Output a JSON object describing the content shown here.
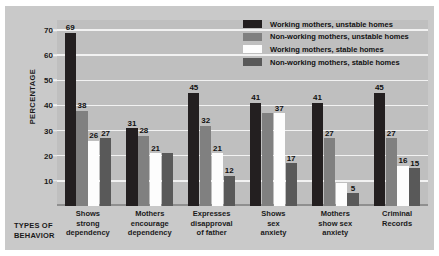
{
  "chart_data": {
    "type": "bar",
    "title": "",
    "xlabel": "TYPES OF BEHAVIOR",
    "ylabel": "PERCENTAGE",
    "ylim": [
      0,
      74
    ],
    "yticks": [
      10,
      20,
      30,
      40,
      50,
      60,
      70
    ],
    "grid": true,
    "legend_position": "top-right",
    "categories": [
      "Shows\nstrong\ndependency",
      "Mothers\nencourage\ndependency",
      "Expresses\ndisapproval\nof father",
      "Shows\nsex\nanxiety",
      "Mothers\nshow sex\nanxiety",
      "Criminal\nRecords"
    ],
    "series": [
      {
        "name": "Working mothers, unstable homes",
        "color": "#231f20",
        "values": [
          69,
          31,
          45,
          41,
          41,
          45
        ]
      },
      {
        "name": "Non-working mothers, unstable homes",
        "color": "#808080",
        "values": [
          38,
          28,
          32,
          37,
          27,
          27
        ]
      },
      {
        "name": "Working mothers, stable homes",
        "color": "#fdfdfd",
        "values": [
          26,
          21,
          21,
          37,
          9,
          16
        ]
      },
      {
        "name": "Non-working mothers, stable homes",
        "color": "#595959",
        "values": [
          27,
          21,
          12,
          17,
          5,
          15
        ]
      }
    ],
    "point_labels": [
      [
        "69",
        "38",
        "26",
        "27"
      ],
      [
        "31",
        "28",
        "21",
        ""
      ],
      [
        "45",
        "32",
        "21",
        "12"
      ],
      [
        "41",
        "",
        "37",
        "17"
      ],
      [
        "41",
        "27",
        "",
        "5"
      ],
      [
        "45",
        "27",
        "16",
        "15"
      ]
    ]
  },
  "axis": {
    "y_title": "PERCENTAGE",
    "x_title_line1": "TYPES OF",
    "x_title_line2": "BEHAVIOR",
    "ticks": [
      "70",
      "60",
      "50",
      "40",
      "30",
      "20",
      "10"
    ]
  },
  "legend": {
    "items": [
      {
        "label": "Working mothers, unstable homes",
        "color": "#231f20"
      },
      {
        "label": "Non-working mothers, unstable homes",
        "color": "#808080"
      },
      {
        "label": "Working mothers, stable homes",
        "color": "#fdfdfd"
      },
      {
        "label": "Non-working mothers, stable homes",
        "color": "#595959"
      }
    ]
  },
  "categories": [
    {
      "l1": "Shows",
      "l2": "strong",
      "l3": "dependency"
    },
    {
      "l1": "Mothers",
      "l2": "encourage",
      "l3": "dependency"
    },
    {
      "l1": "Expresses",
      "l2": "disapproval",
      "l3": "of father"
    },
    {
      "l1": "Shows",
      "l2": "sex",
      "l3": "anxiety"
    },
    {
      "l1": "Mothers",
      "l2": "show sex",
      "l3": "anxiety"
    },
    {
      "l1": "Criminal",
      "l2": "Records",
      "l3": ""
    }
  ],
  "colors": {
    "page_background": "#ffffff",
    "card_background": "#c9c9c9",
    "plot_background": "#bfbfbf",
    "gridline": "#f2f2f2",
    "text": "#1a1a1a"
  }
}
